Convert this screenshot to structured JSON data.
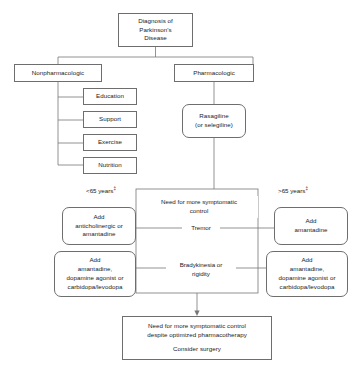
{
  "diagram": {
    "nodes": {
      "diagnosis": {
        "lines": [
          "Diagnosis of",
          "Parkinson's",
          "Disease"
        ]
      },
      "nonpharmacologic": {
        "lines": [
          "Nonpharmacologic"
        ]
      },
      "pharmacologic": {
        "lines": [
          "Pharmacologic"
        ]
      },
      "education": {
        "lines": [
          "Education"
        ]
      },
      "support": {
        "lines": [
          "Support"
        ]
      },
      "exercise": {
        "lines": [
          "Exercise"
        ]
      },
      "nutrition": {
        "lines": [
          "Nutrition"
        ]
      },
      "rasagiline": {
        "lines": [
          "Rasagiline",
          "(or selegiline)"
        ]
      },
      "need_more_control": {
        "lines": [
          "Need for more symptomatic",
          "control"
        ]
      },
      "tremor": {
        "lines": [
          "Tremor"
        ]
      },
      "bradykinesia": {
        "lines": [
          "Bradykinesia or",
          "rigidity"
        ]
      },
      "add_anticholinergic": {
        "lines": [
          "Add",
          "anticholinergic or",
          "amantadine"
        ]
      },
      "add_amantadine_combo_left": {
        "lines": [
          "Add",
          "amantadine,",
          "dopamine agonist or",
          "carbidopa/levodopa"
        ]
      },
      "add_amantadine": {
        "lines": [
          "Add",
          "amantadine"
        ]
      },
      "add_amantadine_combo_right": {
        "lines": [
          "Add",
          "amantadine,",
          "dopamine agonist or",
          "carbidopa/levodopa"
        ]
      },
      "surgery": {
        "lines": [
          "Need for more symptomatic control",
          "despite optimized pharmacotherapy",
          "",
          "Consider surgery"
        ]
      }
    },
    "labels": {
      "age_under_65": {
        "text": "<65 years",
        "footnote": "‡"
      },
      "age_over_65": {
        "text": ">65 years",
        "footnote": "‡"
      }
    },
    "colors": {
      "border": "#6e6e6e",
      "connector": "#777777",
      "text": "#1a1a1a",
      "background": "#ffffff"
    }
  }
}
